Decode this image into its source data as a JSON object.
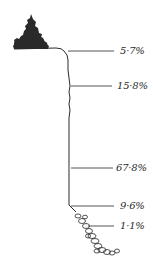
{
  "diagram": {
    "type": "cliff-profile",
    "colors": {
      "ink": "#2a2a2a",
      "background": "#ffffff"
    },
    "segments": [
      {
        "id": "cliff-top",
        "label": "5·7%",
        "y": 51
      },
      {
        "id": "upper-face",
        "label": "15·8%",
        "y": 86
      },
      {
        "id": "main-face",
        "label": "67·8%",
        "y": 168
      },
      {
        "id": "cliff-foot",
        "label": "9·6%",
        "y": 206
      },
      {
        "id": "talus",
        "label": "1·1%",
        "y": 226
      }
    ]
  }
}
